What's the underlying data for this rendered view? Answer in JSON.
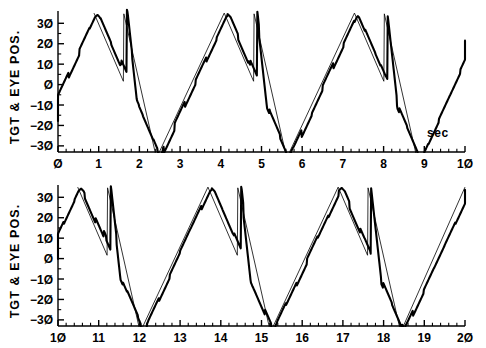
{
  "figure": {
    "kind": "two-panel-time-series",
    "background": "#ffffff",
    "ink": "#000000",
    "y_axis_title": "TGT & EYE POS.",
    "x_unit_label": "sec"
  },
  "chart_data": [
    {
      "type": "line",
      "panel": "top",
      "title": "",
      "xlabel": "sec",
      "ylabel": "TGT & EYE POS.",
      "xlim": [
        0,
        10
      ],
      "ylim": [
        -33,
        37
      ],
      "grid": false,
      "legend": "none",
      "xticks": [
        0,
        1,
        2,
        3,
        4,
        5,
        6,
        7,
        8,
        9,
        10
      ],
      "xticklabels": [
        "0",
        "1",
        "2",
        "3",
        "4",
        "5",
        "6",
        "7",
        "8",
        "9",
        "10"
      ],
      "minor_ticks_per_interval": 5,
      "yticks": [
        30,
        20,
        10,
        0,
        -10,
        -20,
        -30
      ],
      "yticklabels": [
        "30",
        "20",
        "10",
        "0",
        "-10",
        "-20",
        "-30"
      ],
      "series": [
        {
          "name": "target",
          "style": "thin",
          "linewidth": 0.8,
          "color": "#000000",
          "description": "triangular ramp waveform with sawtooth step-back on descending limb, period 3.2 s",
          "waveform": {
            "form": "triangle-with-stepback",
            "period": 3.2,
            "peak": 35,
            "trough": -36,
            "phase_start_value": -17,
            "stepback_fraction": 0.48,
            "stepback_jump": 33
          }
        },
        {
          "name": "eye",
          "style": "thick",
          "linewidth": 2.1,
          "color": "#000000",
          "description": "smooth pursuit of target with saccadic catch-up steps; lags target and clips at negative extreme"
        }
      ]
    },
    {
      "type": "line",
      "panel": "bottom",
      "title": "",
      "xlabel": "",
      "ylabel": "TGT & EYE POS.",
      "xlim": [
        10,
        20
      ],
      "ylim": [
        -33,
        37
      ],
      "grid": false,
      "legend": "none",
      "xticks": [
        10,
        11,
        12,
        13,
        14,
        15,
        16,
        17,
        18,
        19,
        20
      ],
      "xticklabels": [
        "10",
        "11",
        "12",
        "13",
        "14",
        "15",
        "16",
        "17",
        "18",
        "19",
        "20"
      ],
      "minor_ticks_per_interval": 5,
      "yticks": [
        30,
        20,
        10,
        0,
        -10,
        -20,
        -30
      ],
      "yticklabels": [
        "30",
        "20",
        "10",
        "0",
        "-10",
        "-20",
        "-30"
      ],
      "series": [
        {
          "name": "target",
          "style": "thin",
          "linewidth": 0.8,
          "color": "#000000",
          "description": "triangular ramp waveform with sawtooth step-back on descending limb, period 3.2 s, continuous with top panel"
        },
        {
          "name": "eye",
          "style": "thick",
          "linewidth": 2.1,
          "color": "#000000",
          "description": "smooth pursuit of target with saccadic catch-up steps"
        }
      ]
    }
  ]
}
